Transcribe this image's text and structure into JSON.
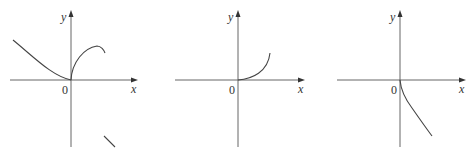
{
  "figure": {
    "panels": [
      {
        "id": "graph-1",
        "y_label": "y",
        "x_label": "x",
        "origin_label": "0",
        "description": "Left branch decreasing to origin, right branch rising to a peak then falling, plus separate short decreasing segment below"
      },
      {
        "id": "graph-2",
        "y_label": "y",
        "x_label": "x",
        "origin_label": "0",
        "description": "Curve starting at origin, increasing and concave up for x > 0"
      },
      {
        "id": "graph-3",
        "y_label": "y",
        "x_label": "x",
        "origin_label": "0",
        "description": "Curve starting at origin with vertical tangent, decreasing for x > 0"
      }
    ]
  },
  "colors": {
    "axis": "#555555",
    "curve": "#444444",
    "background": "#ffffff"
  }
}
